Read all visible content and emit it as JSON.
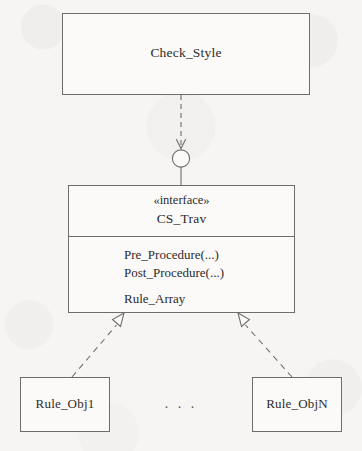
{
  "diagram": {
    "type": "uml-class-diagram",
    "title_text": "",
    "background_color": "#f6f5f3",
    "stroke_color": "#6e6d6b",
    "text_color": "#2b2b2b",
    "nodes": {
      "check_style": {
        "name": "Check_Style",
        "label": "Check_Style",
        "kind": "class"
      },
      "cs_trav": {
        "name": "CS_Trav",
        "stereotype": "«interface»",
        "label": "CS_Trav",
        "kind": "interface",
        "members": [
          "Pre_Procedure(...)",
          "Post_Procedure(...)",
          "Rule_Array"
        ]
      },
      "rule_obj1": {
        "name": "Rule_Obj1",
        "label": "Rule_Obj1",
        "kind": "class"
      },
      "rule_objn": {
        "name": "Rule_ObjN",
        "label": "Rule_ObjN",
        "kind": "class"
      }
    },
    "ellipsis": ". . .",
    "edges": [
      {
        "id": "check-style-to-socket",
        "from": "check_style",
        "to": "cs_trav",
        "style": "dashed",
        "arrow": "open-arrowhead",
        "notation": "required-interface-socket"
      },
      {
        "id": "rule-obj1-realizes-cs-trav",
        "from": "rule_obj1",
        "to": "cs_trav",
        "style": "dashed",
        "arrow": "hollow-triangle",
        "notation": "realization"
      },
      {
        "id": "rule-objn-realizes-cs-trav",
        "from": "rule_objn",
        "to": "cs_trav",
        "style": "dashed",
        "arrow": "hollow-triangle",
        "notation": "realization"
      }
    ]
  }
}
